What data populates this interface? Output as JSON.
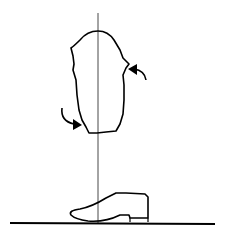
{
  "diagram": {
    "type": "alignment-line-drawing",
    "elements": [
      {
        "name": "plumb-line",
        "description": "vertical reference line"
      },
      {
        "name": "limb-socket-outline",
        "description": "irregular limb/socket cross-section outline"
      },
      {
        "name": "rotation-arrow-right",
        "description": "curved arrow pointing left at right side of outline"
      },
      {
        "name": "rotation-arrow-left",
        "description": "curved arrow pointing right at lower left of outline"
      },
      {
        "name": "shoe",
        "description": "shoe outline resting on ground"
      },
      {
        "name": "ground-line",
        "description": "horizontal floor line"
      }
    ],
    "colors": {
      "stroke": "#000000",
      "background": "#ffffff",
      "plumb": "#333333"
    }
  }
}
